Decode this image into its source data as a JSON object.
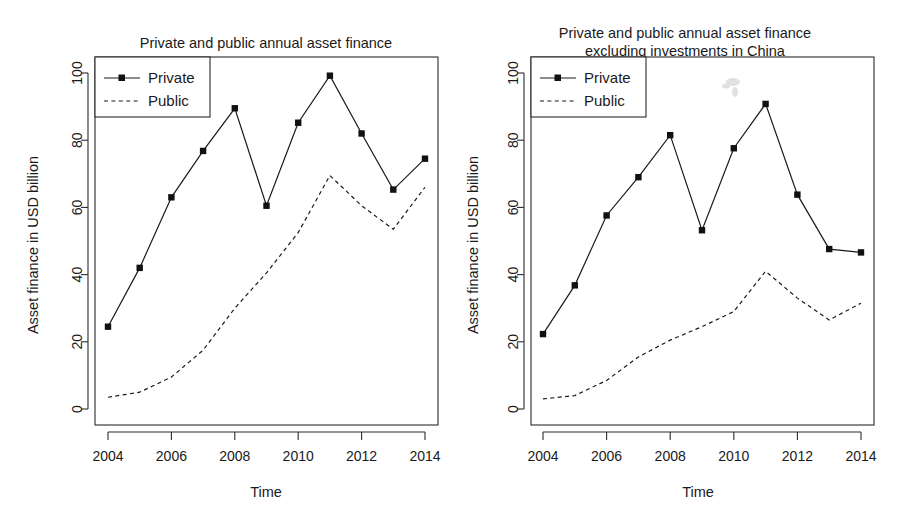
{
  "figure": {
    "background": "#ffffff",
    "ink_color": "#1a1a1a"
  },
  "chart_data": [
    {
      "type": "line",
      "panel": "left",
      "title": "Private and public annual asset finance",
      "title_line2": "",
      "xlabel": "Time",
      "ylabel": "Asset finance in USD billion",
      "x": [
        2004,
        2005,
        2006,
        2007,
        2008,
        2009,
        2010,
        2011,
        2012,
        2013,
        2014
      ],
      "xlim": [
        2003.5,
        2014.5
      ],
      "ylim": [
        0,
        104
      ],
      "xticks": [
        2004,
        2006,
        2008,
        2010,
        2012,
        2014
      ],
      "xtick_labels": [
        "2004",
        "2006",
        "2008",
        "2010",
        "2012",
        "2014"
      ],
      "yticks": [
        0,
        20,
        40,
        60,
        80,
        100
      ],
      "ytick_labels": [
        "0",
        "20",
        "40",
        "60",
        "80",
        "100"
      ],
      "grid": false,
      "legend_position": "top-left",
      "series": [
        {
          "name": "Private",
          "style": "solid-with-square-markers",
          "values": [
            24.5,
            42.0,
            63.0,
            76.8,
            89.5,
            60.5,
            85.2,
            99.2,
            82.0,
            65.3,
            74.5
          ]
        },
        {
          "name": "Public",
          "style": "dashed",
          "values": [
            3.5,
            5.0,
            9.5,
            17.5,
            30.0,
            40.5,
            52.5,
            69.5,
            60.5,
            53.5,
            66.0
          ]
        }
      ]
    },
    {
      "type": "line",
      "panel": "right",
      "title": "Private and public annual asset finance",
      "title_line2": "excluding investments in China",
      "xlabel": "Time",
      "ylabel": "Asset finance in USD billion",
      "x": [
        2004,
        2005,
        2006,
        2007,
        2008,
        2009,
        2010,
        2011,
        2012,
        2013,
        2014
      ],
      "xlim": [
        2003.5,
        2014.5
      ],
      "ylim": [
        0,
        104
      ],
      "xticks": [
        2004,
        2006,
        2008,
        2010,
        2012,
        2014
      ],
      "xtick_labels": [
        "2004",
        "2006",
        "2008",
        "2010",
        "2012",
        "2014"
      ],
      "yticks": [
        0,
        20,
        40,
        60,
        80,
        100
      ],
      "ytick_labels": [
        "0",
        "20",
        "40",
        "60",
        "80",
        "100"
      ],
      "grid": false,
      "legend_position": "top-left",
      "series": [
        {
          "name": "Private",
          "style": "solid-with-square-markers",
          "values": [
            22.3,
            36.8,
            57.6,
            69.0,
            81.5,
            53.2,
            77.6,
            90.8,
            63.8,
            47.6,
            46.6
          ]
        },
        {
          "name": "Public",
          "style": "dashed",
          "values": [
            3.0,
            4.0,
            8.5,
            15.5,
            20.5,
            24.5,
            29.0,
            41.0,
            33.0,
            26.5,
            31.5
          ]
        }
      ]
    }
  ],
  "panels": {
    "left": {
      "title": "Private and public annual asset finance",
      "xlabel": "Time",
      "ylabel": "Asset finance in USD billion",
      "legend": {
        "private_label": "Private",
        "public_label": "Public"
      }
    },
    "right": {
      "title_line1": "Private and public annual asset finance",
      "title_line2": "excluding investments in China",
      "xlabel": "Time",
      "ylabel": "Asset finance in USD billion",
      "legend": {
        "private_label": "Private",
        "public_label": "Public"
      }
    }
  }
}
